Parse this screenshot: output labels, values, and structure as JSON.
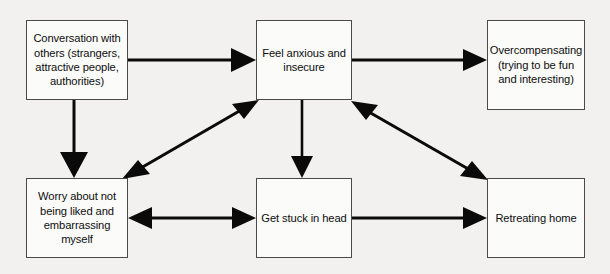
{
  "diagram": {
    "background_color": "#f2f1ef",
    "box_fill_color": "#fbfbfa",
    "box_border_color": "#4a4a4a",
    "arrow_color": "#0a0a0a",
    "text_color": "#0d0d0d",
    "nodes": [
      {
        "id": "conversation",
        "label": "Conversation with others (strangers, attractive people, authorities)"
      },
      {
        "id": "feel_anxious",
        "label": "Feel anxious and insecure"
      },
      {
        "id": "overcompensating",
        "label": "Overcompensating (trying to be fun and interesting)"
      },
      {
        "id": "worry",
        "label": "Worry about not being liked and embarrassing myself"
      },
      {
        "id": "get_stuck",
        "label": "Get stuck in head"
      },
      {
        "id": "retreating",
        "label": "Retreating home"
      }
    ],
    "edges": [
      {
        "id": "conversation-to-feel-anxious",
        "from": "conversation",
        "to": "feel_anxious",
        "direction": "one-way"
      },
      {
        "id": "feel-anxious-to-overcompensating",
        "from": "feel_anxious",
        "to": "overcompensating",
        "direction": "one-way"
      },
      {
        "id": "conversation-to-worry",
        "from": "conversation",
        "to": "worry",
        "direction": "one-way"
      },
      {
        "id": "feel-anxious-to-get-stuck",
        "from": "feel_anxious",
        "to": "get_stuck",
        "direction": "one-way"
      },
      {
        "id": "worry-and-feel-anxious",
        "from": "worry",
        "to": "feel_anxious",
        "direction": "two-way"
      },
      {
        "id": "feel-anxious-and-retreating",
        "from": "feel_anxious",
        "to": "retreating",
        "direction": "two-way"
      },
      {
        "id": "worry-and-get-stuck",
        "from": "worry",
        "to": "get_stuck",
        "direction": "two-way"
      },
      {
        "id": "get-stuck-to-retreating",
        "from": "get_stuck",
        "to": "retreating",
        "direction": "one-way"
      }
    ]
  }
}
